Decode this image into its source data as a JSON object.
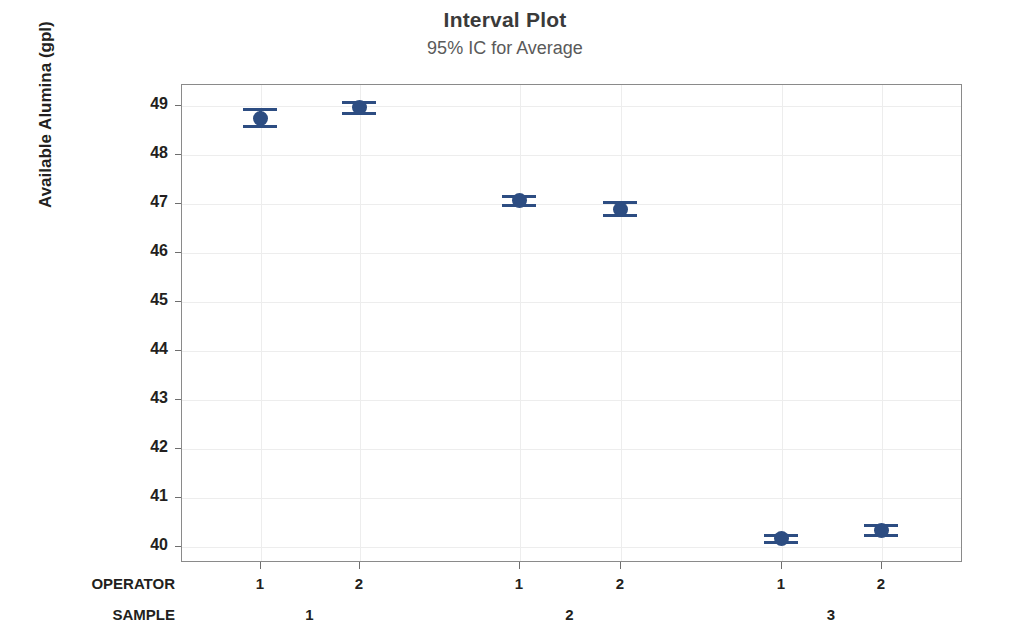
{
  "chart_data": {
    "type": "scatter",
    "title": "Interval Plot",
    "subtitle": "95% IC for Average",
    "xlabel": "",
    "ylabel": "Available Alumina (gpl)",
    "ylim": [
      39.7,
      49.4
    ],
    "yticks": [
      40,
      41,
      42,
      43,
      44,
      45,
      46,
      47,
      48,
      49
    ],
    "grid": true,
    "legend": "none",
    "group_rows": [
      {
        "name": "OPERATOR",
        "values": [
          "1",
          "2",
          "1",
          "2",
          "1",
          "2"
        ]
      },
      {
        "name": "SAMPLE",
        "values": [
          "1",
          "2",
          "3"
        ]
      }
    ],
    "categories": [
      "SAMPLE 1 / OPERATOR 1",
      "SAMPLE 1 / OPERATOR 2",
      "SAMPLE 2 / OPERATOR 1",
      "SAMPLE 2 / OPERATOR 2",
      "SAMPLE 3 / OPERATOR 1",
      "SAMPLE 3 / OPERATOR 2"
    ],
    "points": [
      {
        "label": "S1-O1",
        "mean": 48.73,
        "lower": 48.56,
        "upper": 48.9
      },
      {
        "label": "S1-O2",
        "mean": 48.95,
        "lower": 48.83,
        "upper": 49.06
      },
      {
        "label": "S2-O1",
        "mean": 47.05,
        "lower": 46.96,
        "upper": 47.14
      },
      {
        "label": "S2-O2",
        "mean": 46.88,
        "lower": 46.74,
        "upper": 47.02
      },
      {
        "label": "S3-O1",
        "mean": 40.15,
        "lower": 40.07,
        "upper": 40.23
      },
      {
        "label": "S3-O2",
        "mean": 40.33,
        "lower": 40.23,
        "upper": 40.43
      }
    ],
    "colors": {
      "marker": "#2d4d82",
      "frame": "#8a8a8a",
      "grid": "#ededed",
      "title": "#3a3a3a",
      "subtitle": "#5a5a5a"
    }
  }
}
